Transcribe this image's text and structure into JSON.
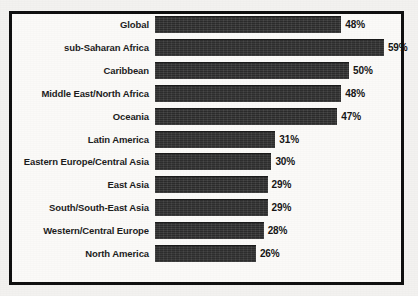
{
  "chart_data": {
    "type": "bar",
    "orientation": "horizontal",
    "title": "",
    "subtitle": "",
    "xlabel": "",
    "ylabel": "",
    "grid": false,
    "legend": null,
    "xlim": [
      0,
      59
    ],
    "value_suffix": "%",
    "categories": [
      "Global",
      "sub-Saharan Africa",
      "Caribbean",
      "Middle East/North Africa",
      "Oceania",
      "Latin America",
      "Eastern Europe/Central Asia",
      "East Asia",
      "South/South-East Asia",
      "Western/Central Europe",
      "North America"
    ],
    "values": [
      48,
      59,
      50,
      48,
      47,
      31,
      30,
      29,
      29,
      28,
      26
    ],
    "value_labels": [
      "48%",
      "59%",
      "50%",
      "48%",
      "47%",
      "31%",
      "30%",
      "29%",
      "29%",
      "28%",
      "26%"
    ],
    "colors": {
      "bar_fill": "#343434",
      "plot_background": "#fbfaf8",
      "page_background": "#f3f2f0",
      "border": "#0e0e0e",
      "label_text": "#1c1c1c",
      "value_text": "#141414"
    }
  }
}
